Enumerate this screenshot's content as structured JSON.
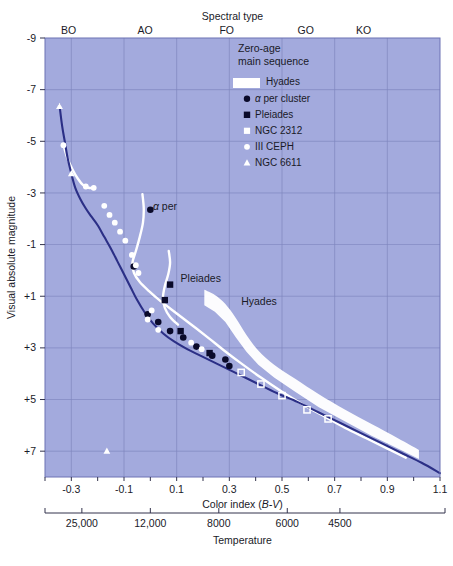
{
  "figure": {
    "plot_bg_color": "#a3aadd",
    "curve_color": "#2b2f86",
    "band_color": "#ffffff",
    "grid_color": "#7f86bf"
  },
  "axes": {
    "top": {
      "title": "Spectral type",
      "ticks": [
        {
          "label": "BO",
          "value": -0.31
        },
        {
          "label": "AO",
          "value": -0.02
        },
        {
          "label": "FO",
          "value": 0.29
        },
        {
          "label": "GO",
          "value": 0.59
        },
        {
          "label": "KO",
          "value": 0.81
        }
      ]
    },
    "left": {
      "title": "Visual absolute magnitude",
      "ticks": [
        "-9",
        "-7",
        "-5",
        "-3",
        "-1",
        "+1",
        "+3",
        "+5",
        "+7"
      ],
      "values": [
        -9,
        -7,
        -5,
        -3,
        -1,
        1,
        3,
        5,
        7
      ],
      "range": [
        -9,
        8
      ]
    },
    "bottom": {
      "title_plain": "Color index (",
      "title_italic": "B-V",
      "title_close": ")",
      "title": "Color index (B-V)",
      "ticks": [
        "-0.3",
        "-0.1",
        "0.1",
        "0.3",
        "0.5",
        "0.7",
        "0.9",
        "1.1"
      ],
      "values": [
        -0.3,
        -0.1,
        0.1,
        0.3,
        0.5,
        0.7,
        0.9,
        1.1
      ],
      "range": [
        -0.4,
        1.1
      ],
      "minor_step": 0.1
    },
    "temperature": {
      "title": "Temperature",
      "ticks": [
        {
          "label": "25,000",
          "value": -0.26
        },
        {
          "label": "12,000",
          "value": 0.0
        },
        {
          "label": "8000",
          "value": 0.26
        },
        {
          "label": "6000",
          "value": 0.52
        },
        {
          "label": "4500",
          "value": 0.72
        }
      ]
    }
  },
  "legend": {
    "title_line1": "Zero-age",
    "title_line2": "main sequence",
    "entries": [
      {
        "label": "Hyades",
        "marker": "band"
      },
      {
        "label": "α per cluster",
        "marker": "circle-filled"
      },
      {
        "label": "Pleiades",
        "marker": "square-filled"
      },
      {
        "label": "NGC 2312",
        "marker": "square-open"
      },
      {
        "label": "III CEPH",
        "marker": "circle-open"
      },
      {
        "label": "NGC 6611",
        "marker": "triangle-open"
      }
    ]
  },
  "annotations": [
    {
      "name": "alpha-per",
      "text": "α per",
      "x": 0.01,
      "y": -2.35
    },
    {
      "name": "pleiades",
      "text": "Pleiades",
      "x": 0.115,
      "y": 0.45
    },
    {
      "name": "hyades",
      "text": "Hyades",
      "x": 0.345,
      "y": 1.35
    }
  ],
  "chart_data": {
    "type": "scatter",
    "xlabel": "Color index (B-V)",
    "ylabel": "Visual absolute magnitude",
    "xlim": [
      -0.4,
      1.1
    ],
    "ylim": [
      -9,
      8
    ],
    "y_inverted": true,
    "grid": true,
    "legend_position": "top-right-inside",
    "series": [
      {
        "name": "Zero-age main sequence",
        "type": "line",
        "color": "#2b2f86",
        "points": [
          [
            -0.345,
            -6.4
          ],
          [
            -0.335,
            -5.6
          ],
          [
            -0.325,
            -5.0
          ],
          [
            -0.315,
            -4.4
          ],
          [
            -0.3,
            -3.75
          ],
          [
            -0.285,
            -3.2
          ],
          [
            -0.265,
            -2.75
          ],
          [
            -0.245,
            -2.4
          ],
          [
            -0.225,
            -2.1
          ],
          [
            -0.2,
            -1.75
          ],
          [
            -0.175,
            -1.3
          ],
          [
            -0.15,
            -0.85
          ],
          [
            -0.125,
            -0.35
          ],
          [
            -0.1,
            0.15
          ],
          [
            -0.075,
            0.65
          ],
          [
            -0.05,
            1.15
          ],
          [
            -0.02,
            1.65
          ],
          [
            0.01,
            2.05
          ],
          [
            0.05,
            2.45
          ],
          [
            0.09,
            2.75
          ],
          [
            0.14,
            3.05
          ],
          [
            0.19,
            3.3
          ],
          [
            0.25,
            3.6
          ],
          [
            0.32,
            3.95
          ],
          [
            0.4,
            4.35
          ],
          [
            0.48,
            4.75
          ],
          [
            0.56,
            5.1
          ],
          [
            0.64,
            5.5
          ],
          [
            0.72,
            5.9
          ],
          [
            0.8,
            6.3
          ],
          [
            0.88,
            6.7
          ],
          [
            0.96,
            7.1
          ],
          [
            1.03,
            7.45
          ],
          [
            1.1,
            7.85
          ]
        ]
      },
      {
        "name": "Hyades",
        "type": "band",
        "color": "#ffffff",
        "upper": [
          [
            0.205,
            0.75
          ],
          [
            0.245,
            0.95
          ],
          [
            0.285,
            1.3
          ],
          [
            0.325,
            1.85
          ],
          [
            0.365,
            2.5
          ],
          [
            0.41,
            3.1
          ],
          [
            0.47,
            3.65
          ],
          [
            0.55,
            4.2
          ],
          [
            0.64,
            4.8
          ],
          [
            0.74,
            5.4
          ],
          [
            0.84,
            5.95
          ],
          [
            0.94,
            6.5
          ],
          [
            1.02,
            6.95
          ]
        ],
        "lower": [
          [
            0.205,
            1.35
          ],
          [
            0.245,
            1.6
          ],
          [
            0.285,
            2.0
          ],
          [
            0.325,
            2.6
          ],
          [
            0.365,
            3.15
          ],
          [
            0.41,
            3.65
          ],
          [
            0.47,
            4.15
          ],
          [
            0.55,
            4.7
          ],
          [
            0.64,
            5.3
          ],
          [
            0.74,
            5.85
          ],
          [
            0.84,
            6.4
          ],
          [
            0.94,
            6.9
          ],
          [
            1.02,
            7.3
          ]
        ]
      },
      {
        "name": "alpha per cluster branch",
        "type": "line",
        "color": "#ffffff",
        "points": [
          [
            -0.03,
            -2.95
          ],
          [
            -0.025,
            -2.4
          ],
          [
            -0.028,
            -1.85
          ],
          [
            -0.04,
            -1.3
          ],
          [
            -0.055,
            -0.75
          ],
          [
            -0.068,
            -0.3
          ],
          [
            -0.062,
            0.1
          ],
          [
            -0.04,
            0.45
          ],
          [
            -0.005,
            0.8
          ],
          [
            0.04,
            1.2
          ],
          [
            0.085,
            1.55
          ],
          [
            0.13,
            1.9
          ],
          [
            0.175,
            2.25
          ],
          [
            0.225,
            2.65
          ],
          [
            0.28,
            3.1
          ],
          [
            0.345,
            3.6
          ],
          [
            0.42,
            4.15
          ],
          [
            0.5,
            4.7
          ],
          [
            0.58,
            5.2
          ],
          [
            0.66,
            5.65
          ],
          [
            0.74,
            6.1
          ],
          [
            0.82,
            6.5
          ],
          [
            0.9,
            6.9
          ],
          [
            0.97,
            7.25
          ]
        ]
      },
      {
        "name": "Pleiades branch",
        "type": "line",
        "color": "#ffffff",
        "points": [
          [
            0.07,
            -0.75
          ],
          [
            0.075,
            -0.3
          ],
          [
            0.068,
            0.15
          ],
          [
            0.055,
            0.6
          ],
          [
            0.048,
            1.05
          ],
          [
            0.055,
            1.45
          ],
          [
            0.075,
            1.8
          ],
          [
            0.105,
            2.1
          ]
        ]
      },
      {
        "name": "upper white track",
        "type": "line",
        "color": "#ffffff",
        "points": [
          [
            -0.33,
            -4.85
          ],
          [
            -0.315,
            -4.35
          ],
          [
            -0.295,
            -3.9
          ],
          [
            -0.275,
            -3.55
          ],
          [
            -0.255,
            -3.3
          ],
          [
            -0.235,
            -3.2
          ],
          [
            -0.215,
            -3.2
          ]
        ]
      },
      {
        "name": "alpha per cluster",
        "type": "scatter",
        "marker": "circle-filled",
        "color": "#0a0a2a",
        "points": [
          [
            0.0,
            -2.35
          ],
          [
            -0.063,
            -0.15
          ],
          [
            -0.01,
            1.7
          ],
          [
            0.03,
            2.0
          ],
          [
            0.075,
            2.35
          ],
          [
            0.125,
            2.6
          ],
          [
            0.175,
            2.95
          ],
          [
            0.235,
            3.3
          ],
          [
            0.3,
            3.7
          ],
          [
            0.285,
            3.45
          ]
        ]
      },
      {
        "name": "Pleiades",
        "type": "scatter",
        "marker": "square-filled",
        "color": "#0a0a2a",
        "points": [
          [
            0.075,
            0.55
          ],
          [
            0.055,
            1.15
          ],
          [
            0.225,
            3.2
          ],
          [
            0.115,
            2.35
          ]
        ]
      },
      {
        "name": "NGC 2312",
        "type": "scatter",
        "marker": "square-open",
        "color": "#ffffff",
        "points": [
          [
            0.345,
            3.95
          ],
          [
            0.5,
            4.85
          ],
          [
            0.595,
            5.4
          ],
          [
            0.675,
            5.75
          ],
          [
            0.42,
            4.4
          ]
        ]
      },
      {
        "name": "III CEPH",
        "type": "scatter",
        "marker": "circle-open",
        "color": "#ffffff",
        "points": [
          [
            -0.33,
            -4.85
          ],
          [
            -0.245,
            -3.25
          ],
          [
            -0.215,
            -3.2
          ],
          [
            -0.175,
            -2.5
          ],
          [
            -0.155,
            -2.15
          ],
          [
            -0.135,
            -1.85
          ],
          [
            -0.115,
            -1.5
          ],
          [
            -0.095,
            -1.15
          ],
          [
            -0.07,
            -0.6
          ],
          [
            -0.055,
            -0.2
          ],
          [
            -0.045,
            0.1
          ],
          [
            0.005,
            1.55
          ],
          [
            0.155,
            2.8
          ],
          [
            0.195,
            3.05
          ],
          [
            -0.01,
            1.9
          ],
          [
            0.03,
            2.3
          ]
        ]
      },
      {
        "name": "NGC 6611",
        "type": "scatter",
        "marker": "triangle-open",
        "color": "#ffffff",
        "points": [
          [
            -0.345,
            -6.35
          ],
          [
            -0.3,
            -3.75
          ],
          [
            -0.165,
            7.0
          ]
        ]
      }
    ]
  }
}
